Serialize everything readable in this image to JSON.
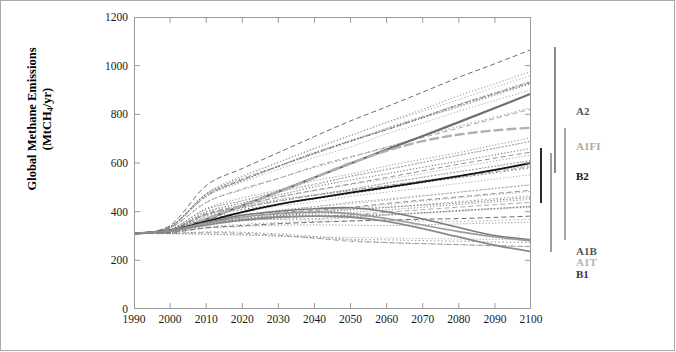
{
  "chart_data": {
    "type": "line",
    "title": "",
    "xlabel": "",
    "ylabel": "Global Methane Emissions (MtCH4/yr)",
    "ylabel_line1": "Global Methane Emissions",
    "ylabel_line2_pre": "(MtCH",
    "ylabel_line2_sub": "4",
    "ylabel_line2_post": "/yr)",
    "xlim": [
      1990,
      2100
    ],
    "ylim": [
      0,
      1200
    ],
    "xticks": [
      1990,
      2000,
      2010,
      2020,
      2030,
      2040,
      2050,
      2060,
      2070,
      2080,
      2090,
      2100
    ],
    "yticks": [
      0,
      200,
      400,
      600,
      800,
      1000,
      1200
    ],
    "grid": false,
    "legend_position": "right",
    "x": [
      1990,
      2000,
      2010,
      2020,
      2030,
      2040,
      2050,
      2060,
      2070,
      2080,
      2090,
      2100
    ],
    "series": [
      {
        "name": "A2",
        "color": "#6e6e6e",
        "style": "solid",
        "width": 2.2,
        "values": [
          310,
          323,
          369,
          425,
          482,
          540,
          598,
          655,
          711,
          768,
          826,
          885
        ]
      },
      {
        "name": "A1FI",
        "color": "#b0b0b0",
        "style": "dashed",
        "width": 2.4,
        "values": [
          310,
          323,
          370,
          425,
          480,
          540,
          600,
          650,
          690,
          717,
          734,
          745
        ]
      },
      {
        "name": "B2",
        "color": "#111111",
        "style": "solid",
        "width": 1.8,
        "values": [
          310,
          323,
          360,
          398,
          430,
          455,
          478,
          500,
          522,
          546,
          572,
          600
        ]
      },
      {
        "name": "A1B",
        "color": "#7a7a7a",
        "style": "solid",
        "width": 1.6,
        "values": [
          310,
          322,
          355,
          385,
          402,
          412,
          416,
          400,
          370,
          335,
          302,
          285
        ]
      },
      {
        "name": "A1T",
        "color": "#9a9a9a",
        "style": "solid",
        "width": 1.6,
        "values": [
          310,
          322,
          352,
          378,
          392,
          398,
          392,
          372,
          345,
          318,
          296,
          280
        ]
      },
      {
        "name": "B1",
        "color": "#8a8a8a",
        "style": "solid",
        "width": 1.8,
        "values": [
          310,
          321,
          345,
          365,
          378,
          382,
          378,
          360,
          330,
          296,
          262,
          236
        ]
      }
    ],
    "range_bars": [
      {
        "name": "A2",
        "color": "#8a8a8a",
        "low": 560,
        "high": 1075
      },
      {
        "name": "A1FI",
        "color": "#a8a8a8",
        "low": 285,
        "high": 745
      },
      {
        "name": "B2",
        "color": "#2b2b2b",
        "low": 437,
        "high": 660
      },
      {
        "name": "B1",
        "color": "#9d9d9d",
        "low": 236,
        "high": 640
      }
    ],
    "annotations": [
      {
        "label": "A2",
        "color": "#555555"
      },
      {
        "label": "A1FI",
        "color": "#a9a9a9"
      },
      {
        "label": "B2",
        "color": "#111111"
      },
      {
        "label": "A1B",
        "color": "#555555"
      },
      {
        "label": "A1T",
        "color": "#b3b3b3"
      },
      {
        "label": "B1",
        "color": "#333333"
      }
    ],
    "scenario_envelope_note": "about forty thin dotted individual SRES scenario trajectories, all converging near 310 MtCH4/yr in 1990 and fanning out between roughly 230 and 1075 MtCH4/yr by 2100"
  },
  "legend": {
    "labels": [
      {
        "text": "A2",
        "top": 88,
        "color": "#555555"
      },
      {
        "text": "A1FI",
        "top": 123,
        "color": "#a9a9a9"
      },
      {
        "text": "B2",
        "top": 153,
        "color": "#111111"
      },
      {
        "text": "A1B",
        "top": 228,
        "color": "#555555"
      },
      {
        "text": "A1T",
        "top": 239,
        "color": "#b3b3b3"
      },
      {
        "text": "B1",
        "top": 251,
        "color": "#333333"
      }
    ]
  }
}
